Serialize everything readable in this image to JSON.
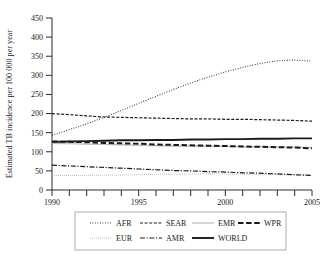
{
  "chart_data": {
    "type": "line",
    "title": "",
    "xlabel": "",
    "ylabel": "Estimated TB incidence per 100 000 per year",
    "xlim": [
      1990,
      2005
    ],
    "ylim": [
      0,
      450
    ],
    "ytick_step": 50,
    "yticks": [
      0,
      50,
      100,
      150,
      200,
      250,
      300,
      350,
      400,
      450
    ],
    "ytick_labels": [
      "0",
      "50",
      "100",
      "150",
      "200",
      "250",
      "300",
      "350",
      "400",
      "450"
    ],
    "xticks": [
      1990,
      1991,
      1992,
      1993,
      1994,
      1995,
      1996,
      1997,
      1998,
      1999,
      2000,
      2001,
      2002,
      2003,
      2004,
      2005
    ],
    "xtick_labels_shown": [
      "1990",
      "1995",
      "2000",
      "2005"
    ],
    "xtick_labels_shown_at": [
      1990,
      1995,
      2000,
      2005
    ],
    "grid": false,
    "legend_position": "below-plot",
    "x": [
      1990,
      1991,
      1992,
      1993,
      1994,
      1995,
      1996,
      1997,
      1998,
      1999,
      2000,
      2001,
      2002,
      2003,
      2004,
      2005
    ],
    "series": [
      {
        "name": "AFR",
        "style": "dotted-fine",
        "color": "#1a1a1a",
        "values": [
          143,
          158,
          173,
          190,
          208,
          227,
          245,
          263,
          280,
          295,
          309,
          321,
          331,
          338,
          340,
          337
        ]
      },
      {
        "name": "SEAR",
        "style": "dashed-short",
        "color": "#1a1a1a",
        "values": [
          200,
          197,
          194,
          191,
          190,
          189,
          188,
          187,
          186,
          186,
          185,
          185,
          184,
          183,
          182,
          180
        ]
      },
      {
        "name": "EMR",
        "style": "solid-light",
        "color": "#b9b9b9",
        "values": [
          122,
          121,
          120,
          119,
          118,
          117,
          116,
          115,
          115,
          114,
          114,
          113,
          113,
          112,
          112,
          111
        ]
      },
      {
        "name": "WPR",
        "style": "dashed-long",
        "color": "#1a1a1a",
        "values": [
          127,
          126,
          125,
          123,
          122,
          121,
          119,
          118,
          117,
          116,
          115,
          114,
          113,
          112,
          111,
          109
        ]
      },
      {
        "name": "EUR",
        "style": "dotted-light",
        "color": "#b0b0b0",
        "values": [
          38,
          38,
          38,
          39,
          39,
          40,
          41,
          41,
          42,
          42,
          42,
          41,
          41,
          40,
          40,
          39
        ]
      },
      {
        "name": "AMR",
        "style": "dash-dot",
        "color": "#1a1a1a",
        "values": [
          65,
          63,
          61,
          59,
          57,
          55,
          53,
          51,
          50,
          48,
          47,
          45,
          44,
          42,
          40,
          38
        ]
      },
      {
        "name": "WORLD",
        "style": "solid-thick",
        "color": "#1a1a1a",
        "values": [
          126,
          127,
          128,
          129,
          130,
          130,
          131,
          131,
          132,
          132,
          133,
          133,
          134,
          134,
          135,
          135
        ]
      }
    ],
    "legend_rows": [
      [
        "AFR",
        "SEAR",
        "EMR",
        "WPR"
      ],
      [
        "EUR",
        "AMR",
        "WORLD"
      ]
    ]
  }
}
